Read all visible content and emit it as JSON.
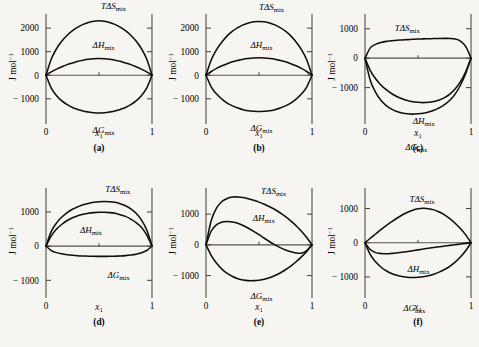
{
  "figure": {
    "axis": {
      "ylabel_main": "J mol",
      "ylabel_exp": "−1",
      "xlabel": "x",
      "xlabel_sub": "1",
      "xtick_left": "0",
      "xtick_right": "1"
    },
    "series_labels": {
      "tds": "TΔS",
      "dh": "ΔH",
      "dg": "ΔG",
      "sub": "mix"
    },
    "panels": [
      {
        "caption": "(a)",
        "yticks": [
          "2000",
          "1000",
          "0",
          "− 1000"
        ],
        "ytick_values": [
          2000,
          1000,
          0,
          -1000
        ],
        "ylim": [
          -1900,
          2600
        ],
        "labels": {
          "tds": "TΔS",
          "dh": "ΔH",
          "dg": "ΔG"
        }
      },
      {
        "caption": "(b)",
        "yticks": [
          "2000",
          "1000",
          "0",
          "− 1000"
        ],
        "ytick_values": [
          2000,
          1000,
          0,
          -1000
        ],
        "ylim": [
          -1900,
          2600
        ],
        "labels": {
          "tds": "TΔS",
          "dh": "ΔH",
          "dg": "ΔG"
        }
      },
      {
        "caption": "(c)",
        "yticks": [
          "1000",
          "0",
          "− 1000"
        ],
        "ytick_values": [
          1000,
          0,
          -1000
        ],
        "ylim": [
          -2100,
          1500
        ],
        "labels": {
          "tds": "TΔS",
          "dh": "ΔH",
          "dg": "ΔG"
        }
      },
      {
        "caption": "(d)",
        "yticks": [
          "1000",
          "0",
          "− 1000"
        ],
        "ytick_values": [
          1000,
          0,
          -1000
        ],
        "ylim": [
          -1400,
          1700
        ],
        "labels": {
          "tds": "TΔS",
          "dh": "ΔH",
          "dg": "ΔG"
        }
      },
      {
        "caption": "(e)",
        "yticks": [
          "1000",
          "0",
          "− 1000"
        ],
        "ytick_values": [
          1000,
          0,
          -1000
        ],
        "ylim": [
          -1600,
          1850
        ],
        "labels": {
          "tds": "TΔS",
          "dh": "ΔH",
          "dg": "ΔG"
        }
      },
      {
        "caption": "(f)",
        "yticks": [
          "1000",
          "0",
          "− 1000"
        ],
        "ytick_values": [
          1000,
          0,
          -1000
        ],
        "ylim": [
          -1500,
          1600
        ],
        "labels": {
          "tds": "TΔS",
          "dh": "ΔH",
          "dg": "ΔG"
        }
      }
    ]
  },
  "chart_data": [
    {
      "type": "line",
      "panel": "(a)",
      "title": "",
      "xlabel": "x1",
      "ylabel": "J mol^-1",
      "xlim": [
        0,
        1
      ],
      "ylim": [
        -1900,
        2600
      ],
      "yticks": [
        2000,
        1000,
        0,
        -1000
      ],
      "xticks": [
        0,
        1
      ],
      "grid": false,
      "legend": "inline-annotations",
      "x": [
        0,
        0.05,
        0.1,
        0.15,
        0.2,
        0.25,
        0.3,
        0.35,
        0.4,
        0.45,
        0.5,
        0.55,
        0.6,
        0.65,
        0.7,
        0.75,
        0.8,
        0.85,
        0.9,
        0.95,
        1
      ],
      "series": [
        {
          "name": "TDeltaS_mix",
          "values": [
            0,
            690,
            1130,
            1450,
            1700,
            1890,
            2040,
            2160,
            2240,
            2290,
            2310,
            2290,
            2240,
            2160,
            2040,
            1890,
            1700,
            1450,
            1130,
            690,
            0
          ]
        },
        {
          "name": "DeltaH_mix",
          "values": [
            0,
            140,
            260,
            360,
            450,
            520,
            590,
            640,
            680,
            700,
            710,
            700,
            680,
            640,
            590,
            520,
            450,
            360,
            260,
            140,
            0
          ]
        },
        {
          "name": "DeltaG_mix",
          "values": [
            0,
            -550,
            -870,
            -1090,
            -1250,
            -1370,
            -1450,
            -1520,
            -1560,
            -1590,
            -1600,
            -1590,
            -1560,
            -1520,
            -1450,
            -1370,
            -1250,
            -1090,
            -870,
            -550,
            0
          ]
        }
      ]
    },
    {
      "type": "line",
      "panel": "(b)",
      "title": "",
      "xlabel": "x1",
      "ylabel": "J mol^-1",
      "xlim": [
        0,
        1
      ],
      "ylim": [
        -1900,
        2600
      ],
      "yticks": [
        2000,
        1000,
        0,
        -1000
      ],
      "xticks": [
        0,
        1
      ],
      "grid": false,
      "legend": "inline-annotations",
      "x": [
        0,
        0.05,
        0.1,
        0.15,
        0.2,
        0.25,
        0.3,
        0.35,
        0.4,
        0.45,
        0.5,
        0.55,
        0.6,
        0.65,
        0.7,
        0.75,
        0.8,
        0.85,
        0.9,
        0.95,
        1
      ],
      "series": [
        {
          "name": "TDeltaS_mix",
          "values": [
            0,
            660,
            1090,
            1410,
            1670,
            1870,
            2020,
            2140,
            2220,
            2270,
            2280,
            2270,
            2220,
            2140,
            2020,
            1870,
            1670,
            1410,
            1090,
            660,
            0
          ]
        },
        {
          "name": "DeltaH_mix",
          "values": [
            0,
            160,
            290,
            400,
            490,
            570,
            630,
            680,
            710,
            730,
            740,
            730,
            710,
            680,
            630,
            570,
            490,
            400,
            290,
            160,
            0
          ]
        },
        {
          "name": "DeltaG_mix",
          "values": [
            0,
            -500,
            -800,
            -1010,
            -1180,
            -1300,
            -1390,
            -1460,
            -1510,
            -1530,
            -1540,
            -1530,
            -1510,
            -1460,
            -1390,
            -1300,
            -1180,
            -1010,
            -800,
            -500,
            0
          ]
        }
      ]
    },
    {
      "type": "line",
      "panel": "(c)",
      "title": "",
      "xlabel": "x1",
      "ylabel": "J mol^-1",
      "xlim": [
        0,
        1
      ],
      "ylim": [
        -2100,
        1500
      ],
      "yticks": [
        1000,
        0,
        -1000
      ],
      "xticks": [
        0,
        1
      ],
      "grid": false,
      "legend": "inline-annotations",
      "x": [
        0,
        0.05,
        0.1,
        0.15,
        0.2,
        0.25,
        0.3,
        0.35,
        0.4,
        0.45,
        0.5,
        0.55,
        0.6,
        0.65,
        0.7,
        0.75,
        0.8,
        0.85,
        0.9,
        0.95,
        1
      ],
      "series": [
        {
          "name": "TDeltaS_mix",
          "values": [
            0,
            350,
            470,
            530,
            570,
            590,
            610,
            620,
            630,
            640,
            650,
            655,
            660,
            665,
            670,
            672,
            670,
            650,
            580,
            400,
            0
          ]
        },
        {
          "name": "DeltaH_mix",
          "values": [
            0,
            -420,
            -700,
            -910,
            -1070,
            -1200,
            -1300,
            -1380,
            -1440,
            -1480,
            -1500,
            -1510,
            -1500,
            -1470,
            -1420,
            -1340,
            -1220,
            -1050,
            -800,
            -460,
            0
          ]
        },
        {
          "name": "DeltaG_mix",
          "values": [
            0,
            -760,
            -1160,
            -1430,
            -1610,
            -1730,
            -1810,
            -1860,
            -1890,
            -1900,
            -1890,
            -1870,
            -1830,
            -1770,
            -1690,
            -1580,
            -1430,
            -1220,
            -920,
            -520,
            0
          ]
        }
      ]
    },
    {
      "type": "line",
      "panel": "(d)",
      "title": "",
      "xlabel": "x1",
      "ylabel": "J mol^-1",
      "xlim": [
        0,
        1
      ],
      "ylim": [
        -1400,
        1700
      ],
      "yticks": [
        1000,
        0,
        -1000
      ],
      "xticks": [
        0,
        1
      ],
      "grid": false,
      "legend": "inline-annotations",
      "x": [
        0,
        0.05,
        0.1,
        0.15,
        0.2,
        0.25,
        0.3,
        0.35,
        0.4,
        0.45,
        0.5,
        0.55,
        0.6,
        0.65,
        0.7,
        0.75,
        0.8,
        0.85,
        0.9,
        0.95,
        1
      ],
      "series": [
        {
          "name": "TDeltaS_mix",
          "values": [
            0,
            430,
            680,
            850,
            980,
            1080,
            1150,
            1210,
            1250,
            1280,
            1300,
            1305,
            1300,
            1280,
            1240,
            1180,
            1090,
            960,
            770,
            480,
            0
          ]
        },
        {
          "name": "DeltaH_mix",
          "values": [
            0,
            300,
            500,
            640,
            750,
            830,
            890,
            930,
            960,
            980,
            990,
            990,
            980,
            960,
            920,
            870,
            790,
            690,
            550,
            330,
            0
          ]
        },
        {
          "name": "DeltaG_mix",
          "values": [
            0,
            -130,
            -190,
            -225,
            -250,
            -268,
            -280,
            -288,
            -294,
            -298,
            -300,
            -300,
            -298,
            -294,
            -288,
            -278,
            -262,
            -238,
            -196,
            -128,
            0
          ]
        }
      ]
    },
    {
      "type": "line",
      "panel": "(e)",
      "title": "",
      "xlabel": "x1",
      "ylabel": "J mol^-1",
      "xlim": [
        0,
        1
      ],
      "ylim": [
        -1600,
        1850
      ],
      "yticks": [
        1000,
        0,
        -1000
      ],
      "xticks": [
        0,
        1
      ],
      "grid": false,
      "legend": "inline-annotations",
      "x": [
        0,
        0.05,
        0.1,
        0.15,
        0.2,
        0.25,
        0.3,
        0.35,
        0.4,
        0.45,
        0.5,
        0.55,
        0.6,
        0.65,
        0.7,
        0.75,
        0.8,
        0.85,
        0.9,
        0.95,
        1
      ],
      "series": [
        {
          "name": "TDeltaS_mix",
          "values": [
            0,
            800,
            1200,
            1410,
            1510,
            1555,
            1560,
            1540,
            1500,
            1450,
            1390,
            1320,
            1240,
            1150,
            1040,
            920,
            780,
            620,
            440,
            240,
            0
          ]
        },
        {
          "name": "DeltaH_mix",
          "values": [
            0,
            450,
            660,
            740,
            760,
            745,
            700,
            630,
            540,
            440,
            330,
            215,
            100,
            0,
            -90,
            -165,
            -225,
            -265,
            -270,
            -190,
            0
          ]
        },
        {
          "name": "DeltaG_mix",
          "values": [
            0,
            -350,
            -600,
            -790,
            -930,
            -1030,
            -1100,
            -1145,
            -1165,
            -1165,
            -1150,
            -1120,
            -1070,
            -1000,
            -915,
            -810,
            -690,
            -550,
            -390,
            -215,
            0
          ]
        }
      ]
    },
    {
      "type": "line",
      "panel": "(f)",
      "title": "",
      "xlabel": "x1",
      "ylabel": "J mol^-1",
      "xlim": [
        0,
        1
      ],
      "ylim": [
        -1500,
        1600
      ],
      "yticks": [
        1000,
        0,
        -1000
      ],
      "xticks": [
        0,
        1
      ],
      "grid": false,
      "legend": "inline-annotations",
      "x": [
        0,
        0.05,
        0.1,
        0.15,
        0.2,
        0.25,
        0.3,
        0.35,
        0.4,
        0.45,
        0.5,
        0.55,
        0.6,
        0.65,
        0.7,
        0.75,
        0.8,
        0.85,
        0.9,
        0.95,
        1
      ],
      "series": [
        {
          "name": "TDeltaS_mix",
          "values": [
            0,
            130,
            255,
            380,
            500,
            610,
            715,
            810,
            890,
            950,
            990,
            1005,
            995,
            960,
            900,
            815,
            705,
            570,
            415,
            230,
            0
          ]
        },
        {
          "name": "DeltaH_mix",
          "values": [
            0,
            -200,
            -290,
            -315,
            -320,
            -312,
            -298,
            -280,
            -258,
            -234,
            -210,
            -186,
            -162,
            -140,
            -118,
            -98,
            -78,
            -58,
            -40,
            -20,
            0
          ]
        },
        {
          "name": "DeltaG_mix",
          "values": [
            0,
            -350,
            -560,
            -710,
            -820,
            -900,
            -955,
            -990,
            -1010,
            -1015,
            -1010,
            -995,
            -965,
            -920,
            -860,
            -785,
            -690,
            -570,
            -420,
            -235,
            0
          ]
        }
      ]
    }
  ]
}
